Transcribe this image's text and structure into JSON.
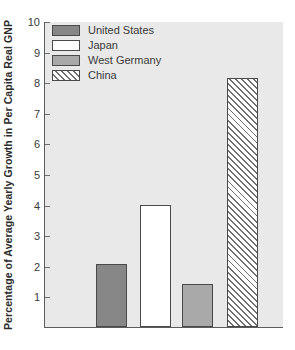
{
  "chart_data": {
    "type": "bar",
    "title": "",
    "xlabel": "",
    "ylabel": "Percentage of Average Yearly Growth in Per Capita Real GNP",
    "ylim": [
      0,
      10
    ],
    "yticks": [
      10,
      9,
      8,
      7,
      6,
      5,
      4,
      3,
      2,
      1
    ],
    "ytick_labels": [
      "10",
      "9",
      "8",
      "7",
      "6",
      "5",
      "4",
      "3",
      "2",
      "1"
    ],
    "grid": false,
    "legend_position": "top-left",
    "categories": [
      "United States",
      "Japan",
      "West Germany",
      "China"
    ],
    "values": [
      2.05,
      4.0,
      1.4,
      8.15
    ],
    "series": [
      {
        "name": "Percentage of Average Yearly Growth in Per Capita Real GNP",
        "values": [
          2.05,
          4.0,
          1.4,
          8.15
        ]
      }
    ],
    "bars": [
      {
        "label": "United States",
        "value": 2.05,
        "fill": "#878787",
        "pattern": "solid"
      },
      {
        "label": "Japan",
        "value": 4.0,
        "fill": "#ffffff",
        "pattern": "solid"
      },
      {
        "label": "West Germany",
        "value": 1.4,
        "fill": "#a9a9a9",
        "pattern": "solid"
      },
      {
        "label": "China",
        "value": 8.15,
        "fill": "#ffffff",
        "pattern": "diagonal-hatch"
      }
    ]
  },
  "legend": {
    "items": [
      {
        "label": "United States",
        "swatch": "#878787"
      },
      {
        "label": "Japan",
        "swatch": "#ffffff"
      },
      {
        "label": "West Germany",
        "swatch": "#a9a9a9"
      },
      {
        "label": "China",
        "swatch": "#ffffff"
      }
    ]
  },
  "colors": {
    "plot_background": "#e9e9e9",
    "axis": "#5c5c5c",
    "text": "#3a3a3a",
    "title_text": "#2b2b2b",
    "bar_border": "#4a4a4a",
    "hatch": "#6f6f6f"
  }
}
